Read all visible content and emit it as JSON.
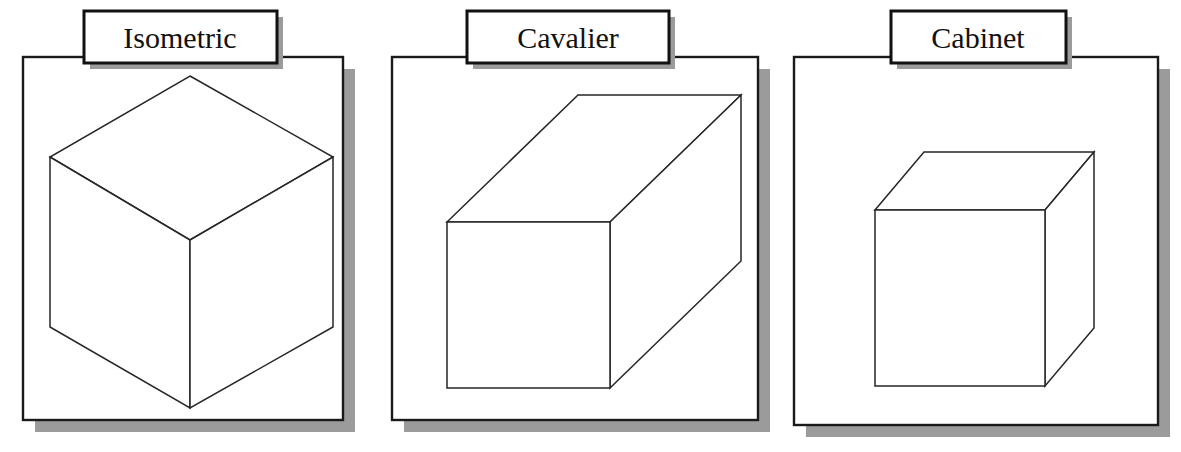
{
  "figure": {
    "background_color": "#ffffff",
    "line_color": "#262626",
    "panel_border_color": "#1a1a1a",
    "shadow_color": "#9b9b9b",
    "label_text_color": "#111111"
  },
  "panels": [
    {
      "id": "isometric",
      "label": "Isometric",
      "panel": {
        "x": 23,
        "y": 57,
        "width": 320,
        "height": 363
      },
      "shadow_offset": {
        "dx": 12,
        "dy": 12
      },
      "label_box": {
        "x": 84,
        "y": 11,
        "width": 193,
        "height": 52
      },
      "label_text_x": 180,
      "label_text_y": 48,
      "cube": {
        "type": "isometric",
        "projection_angle_deg": 30,
        "depth_scale": 1.0,
        "top_apex": {
          "x": 190,
          "y": 76
        },
        "left": {
          "x": 50,
          "y": 157
        },
        "right": {
          "x": 333,
          "y": 157
        },
        "center": {
          "x": 190,
          "y": 240
        },
        "left_bottom": {
          "x": 50,
          "y": 327
        },
        "right_bottom": {
          "x": 333,
          "y": 327
        },
        "bottom": {
          "x": 190,
          "y": 408
        }
      }
    },
    {
      "id": "cavalier",
      "label": "Cavalier",
      "panel": {
        "x": 392,
        "y": 57,
        "width": 366,
        "height": 363
      },
      "shadow_offset": {
        "dx": 12,
        "dy": 12
      },
      "label_box": {
        "x": 467,
        "y": 11,
        "width": 202,
        "height": 52
      },
      "label_text_x": 568,
      "label_text_y": 48,
      "cube": {
        "type": "oblique",
        "projection_angle_deg": 45,
        "depth_scale": 1.0,
        "front_face": {
          "x": 447,
          "y": 222,
          "width": 163,
          "height": 166
        },
        "depth_vector": {
          "dx": 131,
          "dy": -127
        }
      }
    },
    {
      "id": "cabinet",
      "label": "Cabinet",
      "panel": {
        "x": 794,
        "y": 57,
        "width": 364,
        "height": 368
      },
      "shadow_offset": {
        "dx": 12,
        "dy": 12
      },
      "label_box": {
        "x": 891,
        "y": 11,
        "width": 175,
        "height": 52
      },
      "label_text_x": 978,
      "label_text_y": 48,
      "cube": {
        "type": "oblique",
        "projection_angle_deg": 45,
        "depth_scale": 0.5,
        "front_face": {
          "x": 875,
          "y": 210,
          "width": 170,
          "height": 176
        },
        "depth_vector": {
          "dx": 49,
          "dy": -58
        }
      }
    }
  ]
}
